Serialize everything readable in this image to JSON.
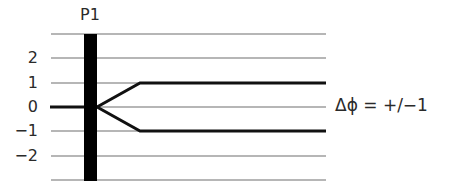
{
  "diagram": {
    "marker_label": "P1",
    "annotation": "Δϕ = +/−1",
    "y_ticks": [
      "2",
      "1",
      "0",
      "−1",
      "−2"
    ],
    "grid_levels": [
      3,
      2,
      1,
      0,
      -1,
      -2,
      -3
    ],
    "colors": {
      "grid": "#6e6e6e",
      "path": "#111111",
      "bar": "#000000",
      "text": "#2a2a2a"
    },
    "paths": [
      {
        "name": "incoming",
        "from_level": 0,
        "to_level": 0
      },
      {
        "name": "branch-up",
        "from_level": 0,
        "to_level": 1
      },
      {
        "name": "branch-down",
        "from_level": 0,
        "to_level": -1
      }
    ]
  }
}
